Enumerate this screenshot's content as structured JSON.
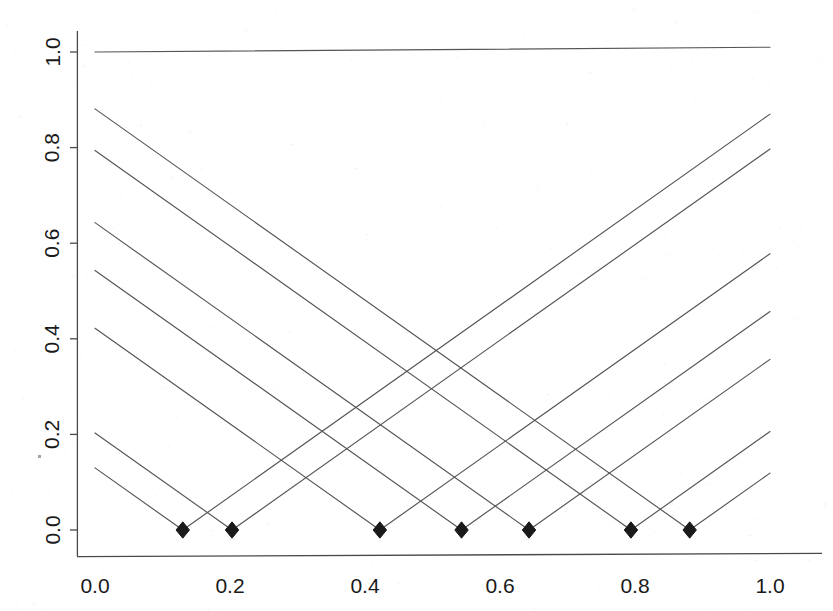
{
  "figure": {
    "background_color": "#ffffff",
    "line_color": "#555555",
    "axis_color": "#4a4a4a",
    "marker_color": "#1a1a1a",
    "tick_label_color": "#1a1a1a"
  },
  "chart_data": {
    "type": "line",
    "title": "",
    "subtitle": "",
    "xlabel": "",
    "ylabel": "",
    "xlim": [
      0.0,
      1.0
    ],
    "ylim": [
      0.0,
      1.05
    ],
    "grid": false,
    "legend": null,
    "legend_position": "none",
    "x_ticks": [
      0.0,
      0.2,
      0.4,
      0.6,
      0.8,
      1.0
    ],
    "x_tick_labels": [
      "0.0",
      "0.2",
      "0.4",
      "0.6",
      "0.8",
      "1.0"
    ],
    "y_ticks": [
      0.0,
      0.2,
      0.4,
      0.6,
      0.8,
      1.0
    ],
    "y_tick_labels": [
      "0.0",
      "0.2",
      "0.4",
      "0.6",
      "0.8",
      "1.0"
    ],
    "y_tick_label_rotation": 90,
    "annotations": [],
    "markers": {
      "shape": "filled-diamond",
      "y": 0.0,
      "x": [
        0.13,
        0.203,
        0.422,
        0.543,
        0.643,
        0.794,
        0.881
      ]
    },
    "series": [
      {
        "name": "constant-one",
        "kind": "segment",
        "points": [
          [
            0.0,
            1.0
          ],
          [
            1.0,
            1.01
          ]
        ]
      },
      {
        "name": "tent-0.13",
        "kind": "v-shape",
        "knot": 0.13,
        "slope": 1.0,
        "points": [
          [
            0.0,
            0.13
          ],
          [
            0.13,
            0.0
          ],
          [
            1.0,
            0.87
          ]
        ]
      },
      {
        "name": "tent-0.203",
        "kind": "v-shape",
        "knot": 0.203,
        "slope": 1.0,
        "points": [
          [
            0.0,
            0.203
          ],
          [
            0.203,
            0.0
          ],
          [
            1.0,
            0.797
          ]
        ]
      },
      {
        "name": "tent-0.422",
        "kind": "v-shape",
        "knot": 0.422,
        "slope": 1.0,
        "points": [
          [
            0.0,
            0.422
          ],
          [
            0.422,
            0.0
          ],
          [
            1.0,
            0.578
          ]
        ]
      },
      {
        "name": "tent-0.543",
        "kind": "v-shape",
        "knot": 0.543,
        "slope": 1.0,
        "points": [
          [
            0.0,
            0.543
          ],
          [
            0.543,
            0.0
          ],
          [
            1.0,
            0.457
          ]
        ]
      },
      {
        "name": "tent-0.643",
        "kind": "v-shape",
        "knot": 0.643,
        "slope": 1.0,
        "points": [
          [
            0.0,
            0.643
          ],
          [
            0.643,
            0.0
          ],
          [
            1.0,
            0.357
          ]
        ]
      },
      {
        "name": "tent-0.794",
        "kind": "v-shape",
        "knot": 0.794,
        "slope": 1.0,
        "points": [
          [
            0.0,
            0.794
          ],
          [
            0.794,
            0.0
          ],
          [
            1.0,
            0.206
          ]
        ]
      },
      {
        "name": "tent-0.881",
        "kind": "v-shape",
        "knot": 0.881,
        "slope": 1.0,
        "points": [
          [
            0.0,
            0.881
          ],
          [
            0.881,
            0.0
          ],
          [
            1.0,
            0.119
          ]
        ]
      }
    ]
  }
}
